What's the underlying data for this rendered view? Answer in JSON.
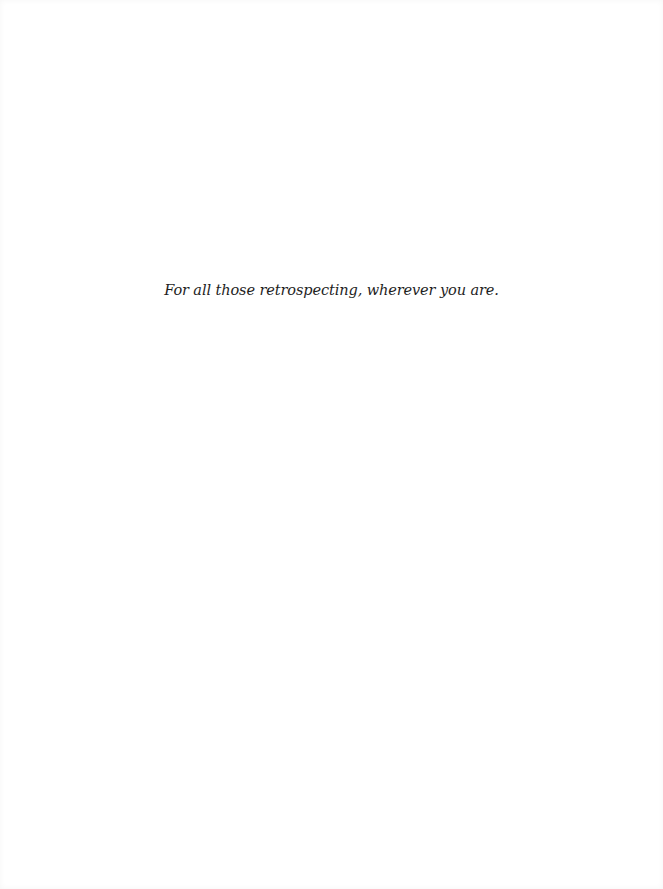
{
  "page": {
    "dedication": "For all those retrospecting, wherever you are."
  },
  "colors": {
    "background": "#ffffff",
    "text": "#1e1e1e"
  }
}
